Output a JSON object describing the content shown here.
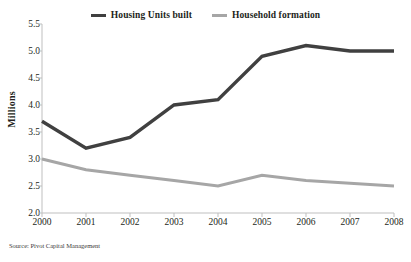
{
  "chart_data": {
    "type": "line",
    "title": "",
    "xlabel": "",
    "ylabel": "Millions",
    "x": [
      "2000",
      "2001",
      "2002",
      "2003",
      "2004",
      "2005",
      "2006",
      "2007",
      "2008"
    ],
    "categories": [
      "2000",
      "2001",
      "2002",
      "2003",
      "2004",
      "2005",
      "2006",
      "2007",
      "2008"
    ],
    "series": [
      {
        "name": "Housing Units built",
        "color": "#404040",
        "values": [
          3.7,
          3.2,
          3.4,
          4.0,
          4.1,
          4.9,
          5.1,
          5.0,
          5.0
        ]
      },
      {
        "name": "Household formation",
        "color": "#a6a6a6",
        "values": [
          3.0,
          2.8,
          2.7,
          2.6,
          2.5,
          2.7,
          2.6,
          2.55,
          2.5
        ]
      }
    ],
    "ylim": [
      2.0,
      5.5
    ],
    "y_ticks": [
      "5.5",
      "5.0",
      "4.5",
      "4.0",
      "3.5",
      "3.0",
      "2.5",
      "2.0"
    ],
    "y_tick_values": [
      5.5,
      5.0,
      4.5,
      4.0,
      3.5,
      3.0,
      2.5,
      2.0
    ],
    "grid": false,
    "legend_position": "top-center",
    "source_note": "Source: Pivot Capital Management"
  },
  "legend": {
    "entries": [
      {
        "label": "Housing Units built",
        "color": "#404040"
      },
      {
        "label": "Household formation",
        "color": "#a6a6a6"
      }
    ]
  },
  "axes": {
    "y_title": "Millions"
  },
  "footer": {
    "source": "Source: Pivot Capital Management"
  }
}
